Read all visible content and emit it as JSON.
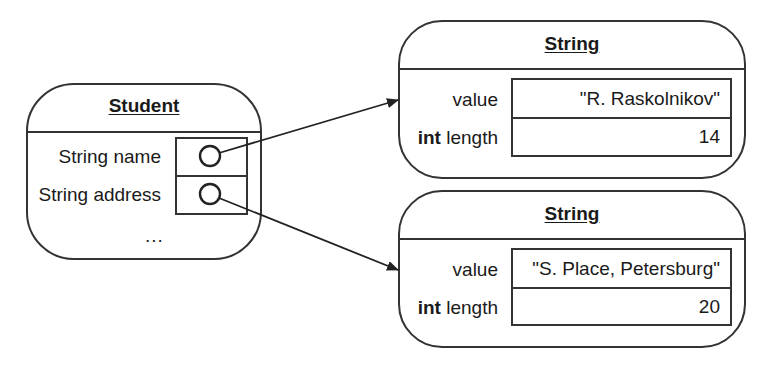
{
  "student": {
    "title": "Student",
    "fields": [
      {
        "label": "String name",
        "kind": "reference"
      },
      {
        "label": "String address",
        "kind": "reference"
      }
    ],
    "ellipsis": "..."
  },
  "strings": [
    {
      "title": "String",
      "value_label": "value",
      "value": "\"R. Raskolnikov\"",
      "length_type": "int",
      "length_label": " length",
      "length": "14"
    },
    {
      "title": "String",
      "value_label": "value",
      "value": "\"S. Place, Petersburg\"",
      "length_type": "int",
      "length_label": " length",
      "length": "20"
    }
  ],
  "arrows": [
    {
      "from": "student.name",
      "to": "strings.0"
    },
    {
      "from": "student.address",
      "to": "strings.1"
    }
  ],
  "colors": {
    "stroke": "#333333",
    "text": "#1a1a1a",
    "background": "#ffffff"
  }
}
